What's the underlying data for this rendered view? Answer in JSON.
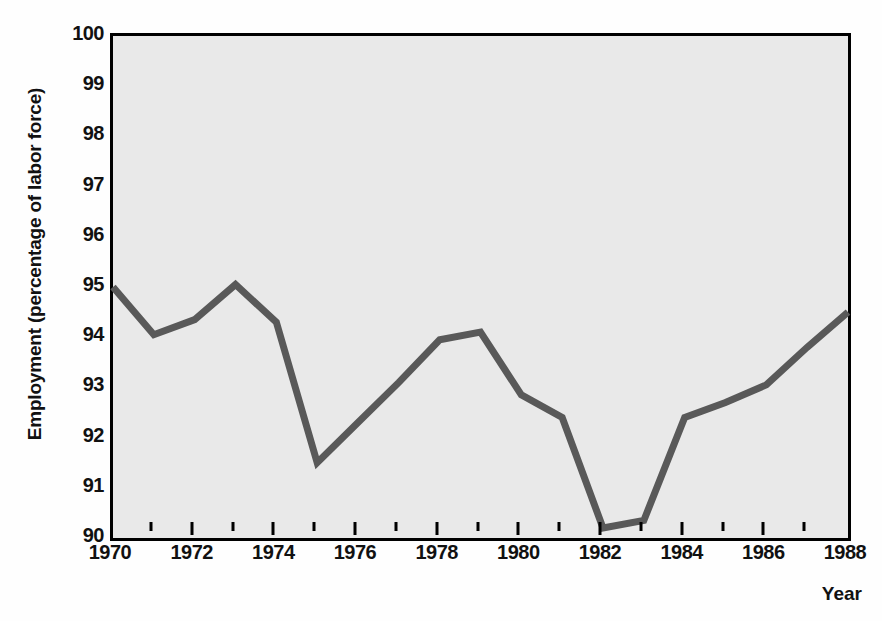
{
  "chart_data": {
    "type": "line",
    "title": "",
    "subtitle": "",
    "xlabel": "Year",
    "ylabel": "Employment (percentage of labor force)",
    "xlim": [
      1970,
      1988
    ],
    "ylim": [
      90,
      100
    ],
    "grid": false,
    "legend": null,
    "legend_position": "none",
    "x_tick_labels": [
      "1970",
      "1972",
      "1974",
      "1976",
      "1978",
      "1980",
      "1982",
      "1984",
      "1986",
      "1988"
    ],
    "x_tick_values": [
      1970,
      1972,
      1974,
      1976,
      1978,
      1980,
      1982,
      1984,
      1986,
      1988
    ],
    "x_minor_tick_values": [
      1971,
      1973,
      1975,
      1977,
      1979,
      1981,
      1983,
      1985,
      1987
    ],
    "y_tick_labels": [
      "90",
      "91",
      "92",
      "93",
      "94",
      "95",
      "96",
      "97",
      "98",
      "99",
      "100"
    ],
    "y_tick_values": [
      90,
      91,
      92,
      93,
      94,
      95,
      96,
      97,
      98,
      99,
      100
    ],
    "x": [
      1970,
      1971,
      1972,
      1973,
      1974,
      1975,
      1976,
      1977,
      1978,
      1979,
      1980,
      1981,
      1982,
      1983,
      1984,
      1985,
      1986,
      1987,
      1988
    ],
    "values": [
      95.0,
      94.05,
      94.35,
      95.05,
      94.3,
      91.5,
      92.3,
      93.1,
      93.95,
      94.1,
      92.85,
      92.4,
      90.2,
      90.35,
      92.4,
      92.7,
      93.05,
      93.8,
      94.5
    ],
    "series": [
      {
        "name": "Employment",
        "values": [
          95.0,
          94.05,
          94.35,
          95.05,
          94.3,
          91.5,
          92.3,
          93.1,
          93.95,
          94.1,
          92.85,
          92.4,
          90.2,
          90.35,
          92.4,
          92.7,
          93.05,
          93.8,
          94.5
        ]
      }
    ],
    "annotations": []
  },
  "style": {
    "line_color": "#595959",
    "plot_background": "#e9e9e9",
    "frame_color": "#000000",
    "figure_background": "#fefefe",
    "text_color": "#111111"
  }
}
